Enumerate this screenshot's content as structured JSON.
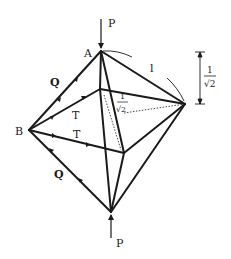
{
  "diagram": {
    "labels": {
      "top_force": "P",
      "bottom_force": "P",
      "vertex_a": "A",
      "vertex_b": "B",
      "upper_edge_force": "Q",
      "lower_edge_force": "Q",
      "upper_tension": "T",
      "lower_tension": "T",
      "edge_length": "l",
      "dimension_numerator": "1",
      "dimension_denominator": "√2",
      "inner_numerator": "1",
      "inner_denominator": "√2"
    },
    "colors": {
      "stroke": "#1a1a1a",
      "background": "#ffffff"
    }
  }
}
